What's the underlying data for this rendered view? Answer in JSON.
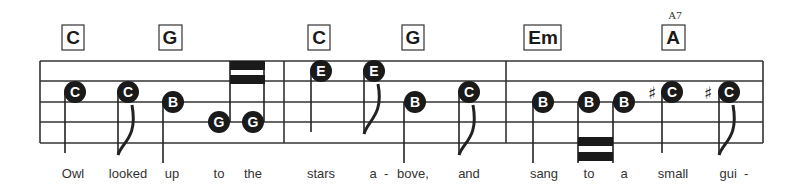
{
  "chords": [
    {
      "label": "C",
      "x": 73
    },
    {
      "label": "G",
      "x": 170
    },
    {
      "label": "C",
      "x": 319
    },
    {
      "label": "G",
      "x": 413
    },
    {
      "label": "Em",
      "x": 543
    },
    {
      "label": "A",
      "x": 673,
      "alt": "A7"
    }
  ],
  "notes": [
    {
      "letter": "C",
      "x": 73,
      "y": 92,
      "stem": "down",
      "duration": "quarter"
    },
    {
      "letter": "C",
      "x": 128,
      "y": 92,
      "stem": "down",
      "duration": "eighth"
    },
    {
      "letter": "B",
      "x": 172,
      "y": 102,
      "stem": "down",
      "duration": "quarter"
    },
    {
      "letter": "G",
      "x": 218,
      "y": 122,
      "stem": "up",
      "duration": "sixteenth"
    },
    {
      "letter": "G",
      "x": 253,
      "y": 122,
      "stem": "up",
      "duration": "sixteenth"
    },
    {
      "letter": "E",
      "x": 320,
      "y": 71,
      "stem": "down",
      "duration": "quarter"
    },
    {
      "letter": "E",
      "x": 374,
      "y": 71,
      "stem": "down",
      "duration": "eighth"
    },
    {
      "letter": "B",
      "x": 414,
      "y": 102,
      "stem": "down",
      "duration": "quarter"
    },
    {
      "letter": "C",
      "x": 469,
      "y": 92,
      "stem": "down",
      "duration": "eighth"
    },
    {
      "letter": "B",
      "x": 544,
      "y": 102,
      "stem": "down",
      "duration": "quarter"
    },
    {
      "letter": "B",
      "x": 589,
      "y": 102,
      "stem": "down",
      "duration": "sixteenth"
    },
    {
      "letter": "B",
      "x": 624,
      "y": 102,
      "stem": "down",
      "duration": "sixteenth"
    },
    {
      "letter": "C",
      "x": 672,
      "y": 92,
      "stem": "down",
      "duration": "quarter",
      "accidental": "♯"
    },
    {
      "letter": "C",
      "x": 729,
      "y": 92,
      "stem": "down",
      "duration": "eighth",
      "accidental": "♯"
    }
  ],
  "lyrics": [
    {
      "text": "Owl",
      "x": 73
    },
    {
      "text": "looked",
      "x": 128
    },
    {
      "text": "up",
      "x": 172
    },
    {
      "text": "to",
      "x": 219
    },
    {
      "text": "the",
      "x": 253
    },
    {
      "text": "stars",
      "x": 321
    },
    {
      "text": "a  -",
      "x": 379
    },
    {
      "text": "bove,",
      "x": 413
    },
    {
      "text": "and",
      "x": 469
    },
    {
      "text": "sang",
      "x": 544
    },
    {
      "text": "to",
      "x": 589
    },
    {
      "text": "a",
      "x": 624
    },
    {
      "text": "small",
      "x": 673
    },
    {
      "text": "gui  -",
      "x": 734
    }
  ]
}
